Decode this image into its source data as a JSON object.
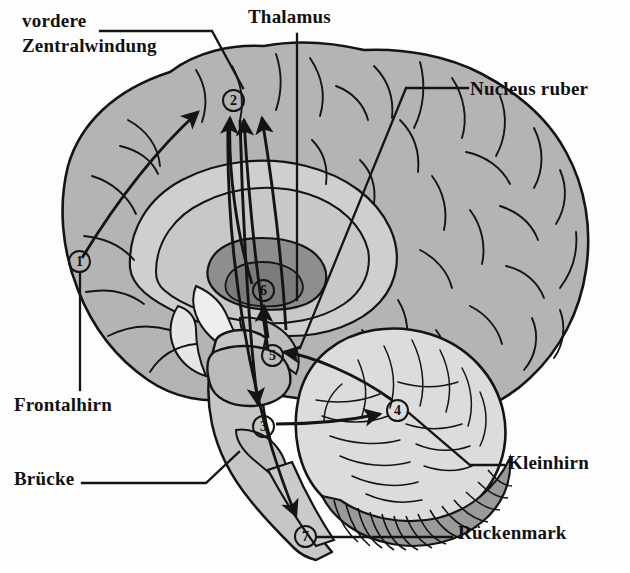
{
  "figure": {
    "language": "de",
    "background_color": "#fdfdfd",
    "ink_color": "#141414",
    "cortex_fill": "#b4b4b4",
    "white_matter_fill": "#cfcfcf",
    "deep_nuclei_fill": "#8e8e8e",
    "cerebellum_fill": "#dcdcdc",
    "brainstem_fill": "#c6c6c6"
  },
  "labels": [
    {
      "id": "vordere-zentralwindung",
      "line1": "vordere",
      "line2": "Zentralwindung",
      "x": 22,
      "y": 8
    },
    {
      "id": "thalamus",
      "text": "Thalamus",
      "x": 248,
      "y": 6
    },
    {
      "id": "nucleus-ruber",
      "text": "Nucleus ruber",
      "x": 470,
      "y": 78
    },
    {
      "id": "frontalhirn",
      "text": "Frontalhirn",
      "x": 14,
      "y": 394
    },
    {
      "id": "bruecke",
      "text": "Brücke",
      "x": 14,
      "y": 468
    },
    {
      "id": "kleinhirn",
      "text": "Kleinhirn",
      "x": 508,
      "y": 452
    },
    {
      "id": "rueckenmark",
      "text": "Rückenmark",
      "x": 458,
      "y": 522
    }
  ],
  "markers": [
    {
      "id": "marker-1",
      "label": "1",
      "x": 68,
      "y": 250
    },
    {
      "id": "marker-2",
      "label": "2",
      "x": 222,
      "y": 89
    },
    {
      "id": "marker-3",
      "label": "3",
      "x": 252,
      "y": 415
    },
    {
      "id": "marker-4",
      "label": "4",
      "x": 386,
      "y": 399
    },
    {
      "id": "marker-5",
      "label": "5",
      "x": 261,
      "y": 344
    },
    {
      "id": "marker-6",
      "label": "6",
      "x": 252,
      "y": 279
    },
    {
      "id": "marker-7",
      "label": "7",
      "x": 294,
      "y": 525
    }
  ],
  "legend_note": {
    "marker_count": 7,
    "marker_sequence": "1 2 3 4 5 6 7"
  }
}
